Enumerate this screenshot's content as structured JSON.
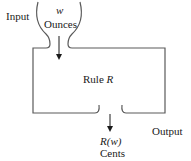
{
  "diagram": {
    "input_label": "Input",
    "input_variable": "w",
    "input_unit": "Ounces",
    "rule_prefix": "Rule ",
    "rule_name": "R",
    "output_label": "Output",
    "output_expr": "R(w)",
    "output_unit": "Cents",
    "colors": {
      "stroke": "#5a5a5a",
      "text": "#1a1a1a",
      "background": "#ffffff"
    }
  }
}
